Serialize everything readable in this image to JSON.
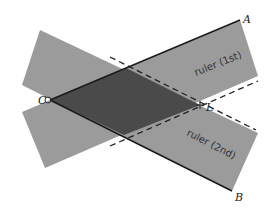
{
  "diagram": {
    "points": {
      "A": {
        "label": "A",
        "x": 240,
        "y": 20
      },
      "B": {
        "label": "B",
        "x": 232,
        "y": 191
      },
      "C": {
        "label": "C",
        "x": 50,
        "y": 100
      },
      "L": {
        "label": "L",
        "x": 200,
        "y": 105
      }
    },
    "rulers": [
      {
        "label": "ruler (1st)",
        "direction": "along CA"
      },
      {
        "label": "ruler (2nd)",
        "direction": "along CB"
      }
    ],
    "colors": {
      "ruler": "#9b9b9b",
      "overlap": "#4a4a4a",
      "line": "#1a1a1a",
      "dash": "#222222"
    }
  }
}
